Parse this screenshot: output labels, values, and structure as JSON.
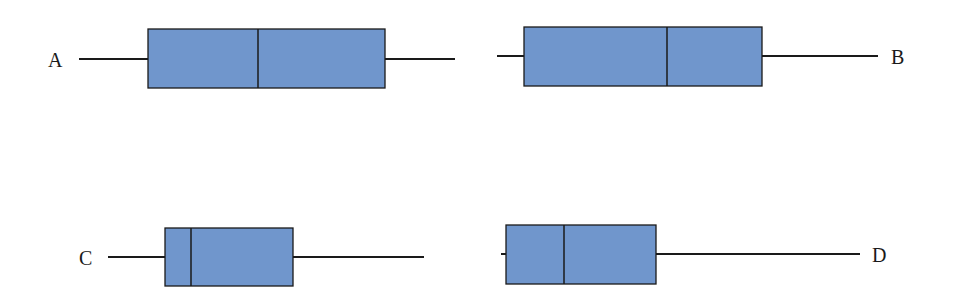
{
  "chart_data": {
    "type": "boxplot",
    "title": "",
    "xlabel": "",
    "ylabel": "",
    "grid": false,
    "box_color": "#7096cc",
    "line_color": "#1a1a1a",
    "series": [
      {
        "name": "A",
        "min": 79,
        "q1": 148,
        "median": 258,
        "q3": 385,
        "max": 455,
        "box_top": 29,
        "box_bottom": 88,
        "whisker_y": 59,
        "label_x": 48,
        "label_y": 67,
        "label_anchor": "start"
      },
      {
        "name": "B",
        "min": 497,
        "q1": 524,
        "median": 667,
        "q3": 762,
        "max": 878,
        "box_top": 27,
        "box_bottom": 86,
        "whisker_y": 56,
        "label_x": 891,
        "label_y": 64,
        "label_anchor": "start"
      },
      {
        "name": "C",
        "min": 108,
        "q1": 165,
        "median": 191,
        "q3": 293,
        "max": 424,
        "box_top": 228,
        "box_bottom": 286,
        "whisker_y": 257,
        "label_x": 79,
        "label_y": 265,
        "label_anchor": "start"
      },
      {
        "name": "D",
        "min": 501,
        "q1": 506,
        "median": 564,
        "q3": 656,
        "max": 860,
        "box_top": 225,
        "box_bottom": 284,
        "whisker_y": 254,
        "label_x": 872,
        "label_y": 262,
        "label_anchor": "start"
      }
    ]
  }
}
